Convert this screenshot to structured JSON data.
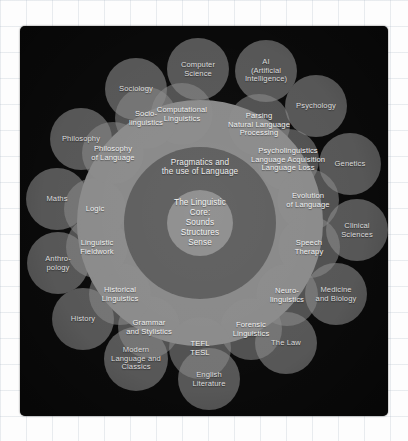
{
  "figure": {
    "type": "concentric-circles-diagram",
    "panel_background": "#0a0a0a",
    "page_background": "#fdfdfd",
    "text_color": "#e9e9e9"
  },
  "core": {
    "label": "The Linguistic\nCore:\nSounds\nStructures\nSense",
    "fill": "#8e8e8e",
    "cx": 180,
    "cy": 197,
    "r": 33
  },
  "pragmatics_ring": {
    "label": "Pragmatics and\nthe use of Language",
    "fill": "#5e5e5e",
    "cx": 180,
    "cy": 197,
    "r": 76,
    "label_cx": 180,
    "label_cy": 141
  },
  "applied_ring": {
    "fill": "#898989",
    "cx": 180,
    "cy": 197,
    "r": 123
  },
  "inner_disciplines": [
    {
      "label": "Computational\nLinguistics",
      "cx": 162,
      "cy": 88,
      "fill": "#8d8d8d"
    },
    {
      "label": "Parsing\nNatural Language\nProcessing",
      "cx": 239,
      "cy": 99,
      "fill": "#8d8d8d"
    },
    {
      "label": "Psycholinguistics\nLanguage Acquisition\nLanguage Loss",
      "cx": 268,
      "cy": 134,
      "fill": "#8d8d8d"
    },
    {
      "label": "Evolution\nof Language",
      "cx": 288,
      "cy": 174,
      "fill": "#8d8d8d"
    },
    {
      "label": "Speech\nTherapy",
      "cx": 289,
      "cy": 221,
      "fill": "#8d8d8d"
    },
    {
      "label": "Neuro-\nlinguistics",
      "cx": 267,
      "cy": 269,
      "fill": "#8d8d8d"
    },
    {
      "label": "Forensic\nLinguistics",
      "cx": 231,
      "cy": 303,
      "fill": "#8d8d8d"
    },
    {
      "label": "TEFL\nTESL",
      "cx": 180,
      "cy": 322,
      "fill": "#8d8d8d"
    },
    {
      "label": "Grammar\nand Stylistics",
      "cx": 129,
      "cy": 301,
      "fill": "#8d8d8d"
    },
    {
      "label": "Historical\nLinguistics",
      "cx": 100,
      "cy": 268,
      "fill": "#8d8d8d"
    },
    {
      "label": "Linguistic\nFieldwork",
      "cx": 77,
      "cy": 221,
      "fill": "#8d8d8d"
    },
    {
      "label": "Logic",
      "cx": 75,
      "cy": 183,
      "fill": "#8d8d8d"
    },
    {
      "label": "Philosophy\nof Language",
      "cx": 93,
      "cy": 127,
      "fill": "#8d8d8d"
    },
    {
      "label": "Socio-\nlinguistics",
      "cx": 126,
      "cy": 92,
      "fill": "#8d8d8d"
    }
  ],
  "outer_disciplines": [
    {
      "label": "Computer\nScience",
      "cx": 178,
      "cy": 43,
      "r": 31,
      "fill": "#575757"
    },
    {
      "label": "AI\n(Artificial\nIntelligence)",
      "cx": 246,
      "cy": 45,
      "r": 31,
      "fill": "#575757"
    },
    {
      "label": "Psychology",
      "cx": 296,
      "cy": 80,
      "r": 31,
      "fill": "#575757"
    },
    {
      "label": "Genetics",
      "cx": 330,
      "cy": 138,
      "r": 31,
      "fill": "#575757"
    },
    {
      "label": "Clinical\nSciences",
      "cx": 337,
      "cy": 204,
      "r": 31,
      "fill": "#575757"
    },
    {
      "label": "Medicine\nand Biology",
      "cx": 316,
      "cy": 268,
      "r": 31,
      "fill": "#575757"
    },
    {
      "label": "The Law",
      "cx": 266,
      "cy": 317,
      "r": 31,
      "fill": "#575757"
    },
    {
      "label": "English\nLiterature",
      "cx": 189,
      "cy": 353,
      "r": 31,
      "fill": "#575757"
    },
    {
      "label": "Modern\nLanguage and\nClassics",
      "cx": 116,
      "cy": 333,
      "r": 32,
      "fill": "#575757"
    },
    {
      "label": "History",
      "cx": 63,
      "cy": 293,
      "r": 31,
      "fill": "#575757"
    },
    {
      "label": "Anthro-\npology",
      "cx": 38,
      "cy": 237,
      "r": 31,
      "fill": "#575757"
    },
    {
      "label": "Maths",
      "cx": 37,
      "cy": 173,
      "r": 31,
      "fill": "#575757"
    },
    {
      "label": "Philosophy",
      "cx": 61,
      "cy": 113,
      "r": 31,
      "fill": "#575757"
    },
    {
      "label": "Sociology",
      "cx": 116,
      "cy": 63,
      "r": 31,
      "fill": "#575757"
    }
  ]
}
